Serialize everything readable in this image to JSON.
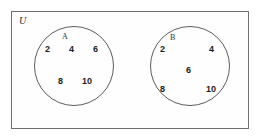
{
  "figure": {
    "type": "venn-diagram",
    "universe_label": "U",
    "border_color": "#6e6e6e",
    "circle_color": "#5c5c5c",
    "text_color": "#1c1c1c",
    "background": "#ffffff"
  },
  "sets": [
    {
      "id": "a",
      "label": "A",
      "elements": [
        "2",
        "4",
        "6",
        "8",
        "10"
      ]
    },
    {
      "id": "b",
      "label": "B",
      "elements": [
        "2",
        "4",
        "6",
        "8",
        "10"
      ]
    }
  ]
}
